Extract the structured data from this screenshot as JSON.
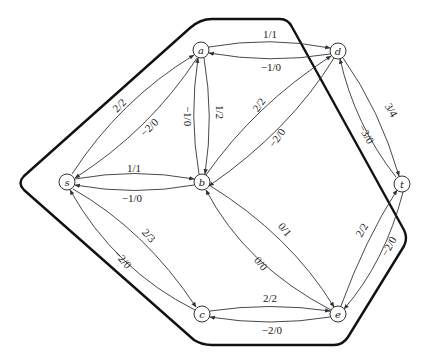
{
  "diagram": {
    "title": "",
    "nodes": [
      {
        "id": "s",
        "label": "s",
        "x": 67,
        "y": 182
      },
      {
        "id": "a",
        "label": "a",
        "x": 201,
        "y": 50
      },
      {
        "id": "b",
        "label": "b",
        "x": 202,
        "y": 182
      },
      {
        "id": "c",
        "label": "c",
        "x": 202,
        "y": 314
      },
      {
        "id": "d",
        "label": "d",
        "x": 338,
        "y": 51
      },
      {
        "id": "e",
        "label": "e",
        "x": 338,
        "y": 314
      },
      {
        "id": "t",
        "label": "t",
        "x": 402,
        "y": 184
      }
    ],
    "edges": [
      {
        "from": "s",
        "to": "a",
        "label": "2/2"
      },
      {
        "from": "a",
        "to": "s",
        "label": "−2/0"
      },
      {
        "from": "s",
        "to": "b",
        "label": "1/1"
      },
      {
        "from": "b",
        "to": "s",
        "label": "−1/0"
      },
      {
        "from": "s",
        "to": "c",
        "label": "2/3"
      },
      {
        "from": "c",
        "to": "s",
        "label": "−2/0"
      },
      {
        "from": "a",
        "to": "d",
        "label": "1/1"
      },
      {
        "from": "d",
        "to": "a",
        "label": "−1/0"
      },
      {
        "from": "a",
        "to": "b",
        "label": "1/2"
      },
      {
        "from": "b",
        "to": "a",
        "label": "−1/0"
      },
      {
        "from": "b",
        "to": "d",
        "label": "2/2"
      },
      {
        "from": "d",
        "to": "b",
        "label": "−2/0"
      },
      {
        "from": "b",
        "to": "e",
        "label": "0/1"
      },
      {
        "from": "e",
        "to": "b",
        "label": "0/0"
      },
      {
        "from": "c",
        "to": "e",
        "label": "2/2"
      },
      {
        "from": "e",
        "to": "c",
        "label": "−2/0"
      },
      {
        "from": "d",
        "to": "t",
        "label": "3/4"
      },
      {
        "from": "t",
        "to": "d",
        "label": "−3/0"
      },
      {
        "from": "e",
        "to": "t",
        "label": "2/2"
      },
      {
        "from": "t",
        "to": "e",
        "label": "−2/0"
      }
    ],
    "cut_boundary": "thick closed polyline enclosing s, a, b, c, e"
  }
}
